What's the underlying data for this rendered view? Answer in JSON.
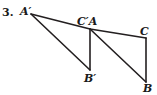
{
  "figure": {
    "item_number": "3.",
    "background_color": "#ffffff",
    "stroke_color": "#231f20",
    "stroke_width": 1.6,
    "canvas": {
      "width": 157,
      "height": 95
    },
    "labels": [
      {
        "id": "a_prime",
        "text": "A′",
        "x": 20,
        "y": 6
      },
      {
        "id": "c_prime_a",
        "text": "C′A",
        "x": 77,
        "y": 16
      },
      {
        "id": "c",
        "text": "C",
        "x": 140,
        "y": 26
      },
      {
        "id": "b_prime",
        "text": "B′",
        "x": 84,
        "y": 73
      },
      {
        "id": "b",
        "text": "B",
        "x": 143,
        "y": 83
      }
    ],
    "vertices": {
      "A_prime": {
        "x": 31,
        "y": 14
      },
      "C_prime": {
        "x": 90,
        "y": 29
      },
      "B_prime": {
        "x": 90,
        "y": 70
      },
      "A": {
        "x": 90,
        "y": 29
      },
      "C": {
        "x": 146,
        "y": 38
      },
      "B": {
        "x": 146,
        "y": 82
      }
    },
    "segments": [
      {
        "id": "seg-a-prime-c-prime",
        "from": "A_prime",
        "to": "C_prime"
      },
      {
        "id": "seg-a-prime-b-prime",
        "from": "A_prime",
        "to": "B_prime"
      },
      {
        "id": "seg-c-prime-b-prime",
        "from": "C_prime",
        "to": "B_prime"
      },
      {
        "id": "seg-a-c",
        "from": "A",
        "to": "C"
      },
      {
        "id": "seg-a-b",
        "from": "A",
        "to": "B"
      },
      {
        "id": "seg-c-b",
        "from": "C",
        "to": "B"
      }
    ],
    "triangles": [
      {
        "id": "triangle-a-prime-c-prime-b-prime",
        "name": "A′C′B′"
      },
      {
        "id": "triangle-a-c-b",
        "name": "ACB"
      }
    ]
  }
}
